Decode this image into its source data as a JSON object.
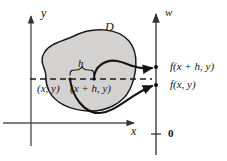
{
  "figure": {
    "domain_label": "D",
    "axes": {
      "y_axis_label": "y",
      "x_axis_label": "x",
      "w_axis_label": "w",
      "w_origin_label": "0"
    },
    "increment_label": "h",
    "points": [
      {
        "id": "point-xy",
        "label": "(x, y)"
      },
      {
        "id": "point-xhy",
        "label": "(x + h, y)"
      }
    ],
    "values": [
      {
        "id": "value-fxhy",
        "label": "f(x + h, y)"
      },
      {
        "id": "value-fxy",
        "label": "f(x, y)"
      }
    ],
    "colors": {
      "ink": "#121212",
      "region_fill": "#d4d2d0",
      "region_stroke": "#1a1a1a",
      "axis": "#555555",
      "dashed": "#1a1a1a"
    }
  }
}
